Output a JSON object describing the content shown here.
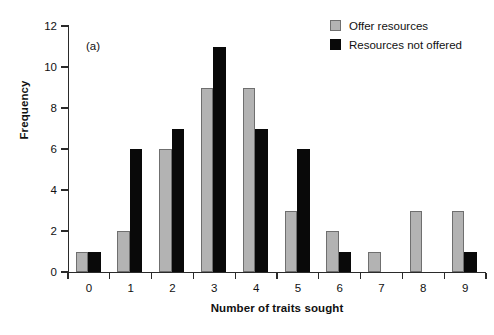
{
  "panel": {
    "label": "(a)"
  },
  "legend": {
    "position": "top-right",
    "entries": [
      {
        "label": "Offer resources",
        "color": "#b3b3b3",
        "swatch": "gray-swatch"
      },
      {
        "label": "Resources not offered",
        "color": "#090909",
        "swatch": "black-swatch"
      }
    ]
  },
  "axes": {
    "x_title": "Number of traits sought",
    "y_title": "Frequency",
    "x_ticks": [
      "0",
      "1",
      "2",
      "3",
      "4",
      "5",
      "6",
      "7",
      "8",
      "9"
    ],
    "y_ticks": [
      "0",
      "2",
      "4",
      "6",
      "8",
      "10",
      "12"
    ]
  },
  "chart_data": {
    "type": "bar",
    "title": "(a)",
    "xlabel": "Number of traits sought",
    "ylabel": "Frequency",
    "categories": [
      "0",
      "1",
      "2",
      "3",
      "4",
      "5",
      "6",
      "7",
      "8",
      "9"
    ],
    "series": [
      {
        "name": "Offer resources",
        "color": "#b3b3b3",
        "values": [
          1,
          2,
          6,
          9,
          9,
          3,
          2,
          1,
          3,
          3
        ]
      },
      {
        "name": "Resources not offered",
        "color": "#090909",
        "values": [
          1,
          6,
          7,
          11,
          7,
          6,
          1,
          0,
          0,
          1
        ]
      }
    ],
    "ylim": [
      0,
      12
    ],
    "ytick_step": 2,
    "grid": false,
    "legend_position": "top-right",
    "bar_mode": "grouped"
  }
}
